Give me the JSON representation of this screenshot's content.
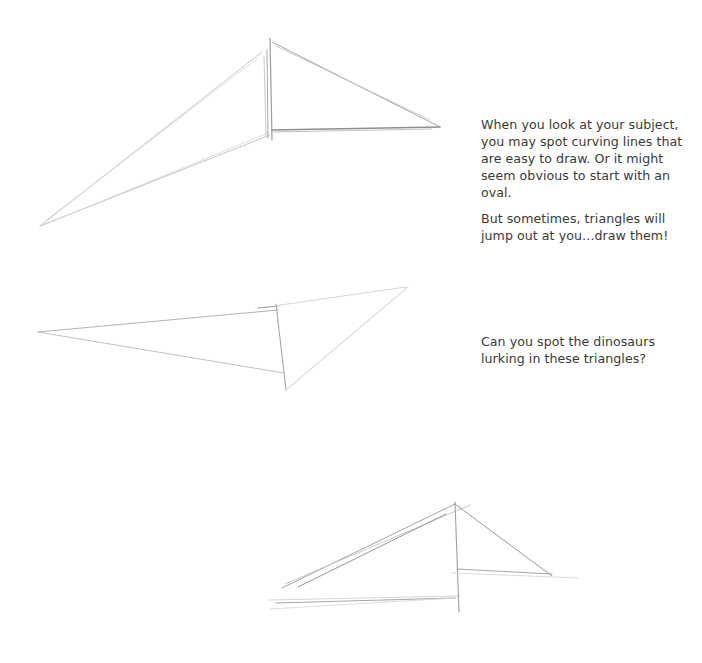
{
  "page": {
    "background": "#ffffff",
    "text_color": "#3a3a3a",
    "pencil_color": "#9a9a9a"
  },
  "text": {
    "intro": "When you look at your subject, you may spot curving lines that are easy to draw. Or it might seem obvious to start with an oval.",
    "triangles": "But sometimes, triangles will jump out at you…draw them!",
    "question": "Can you spot the dinosaurs lurking in these triangles?"
  },
  "sketches": [
    {
      "name": "triangle-sketch-1",
      "description": "pencil triangle sketch: long thin triangle pointing left with a right triangle attached on the right"
    },
    {
      "name": "triangle-sketch-2",
      "description": "pencil triangle sketch: long narrow triangle pointing left with a triangle pointing up-right"
    },
    {
      "name": "triangle-sketch-3",
      "description": "pencil triangle sketch: wide triangle rising to a peak with a smaller triangle on the right"
    }
  ]
}
